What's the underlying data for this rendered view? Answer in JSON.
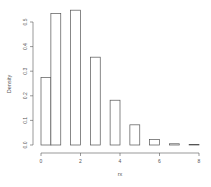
{
  "chart_data": {
    "type": "bar",
    "title": "",
    "xlabel": "rx",
    "ylabel": "Density",
    "xlim": [
      0,
      8
    ],
    "ylim": [
      0,
      0.55
    ],
    "grid": false,
    "legend": null,
    "x_ticks": [
      "0",
      "2",
      "4",
      "6",
      "8"
    ],
    "y_ticks": [
      "0.0",
      "0.1",
      "0.2",
      "0.3",
      "0.4",
      "0.5"
    ],
    "bins": [
      {
        "left": 0.0,
        "right": 0.5,
        "density": 0.275
      },
      {
        "left": 0.5,
        "right": 1.0,
        "density": 0.535
      },
      {
        "left": 1.0,
        "right": 1.5,
        "density": 0.0
      },
      {
        "left": 1.5,
        "right": 2.0,
        "density": 0.548
      },
      {
        "left": 2.0,
        "right": 2.5,
        "density": 0.0
      },
      {
        "left": 2.5,
        "right": 3.0,
        "density": 0.357
      },
      {
        "left": 3.0,
        "right": 3.5,
        "density": 0.0
      },
      {
        "left": 3.5,
        "right": 4.0,
        "density": 0.182
      },
      {
        "left": 4.0,
        "right": 4.5,
        "density": 0.0
      },
      {
        "left": 4.5,
        "right": 5.0,
        "density": 0.082
      },
      {
        "left": 5.0,
        "right": 5.5,
        "density": 0.0
      },
      {
        "left": 5.5,
        "right": 6.0,
        "density": 0.022
      },
      {
        "left": 6.0,
        "right": 6.5,
        "density": 0.0
      },
      {
        "left": 6.5,
        "right": 7.0,
        "density": 0.005
      },
      {
        "left": 7.0,
        "right": 7.5,
        "density": 0.0
      },
      {
        "left": 7.5,
        "right": 8.0,
        "density": 0.002
      }
    ],
    "colors": {
      "bar_fill": "#ffffff",
      "bar_stroke": "#555555",
      "axis": "#555555"
    }
  }
}
